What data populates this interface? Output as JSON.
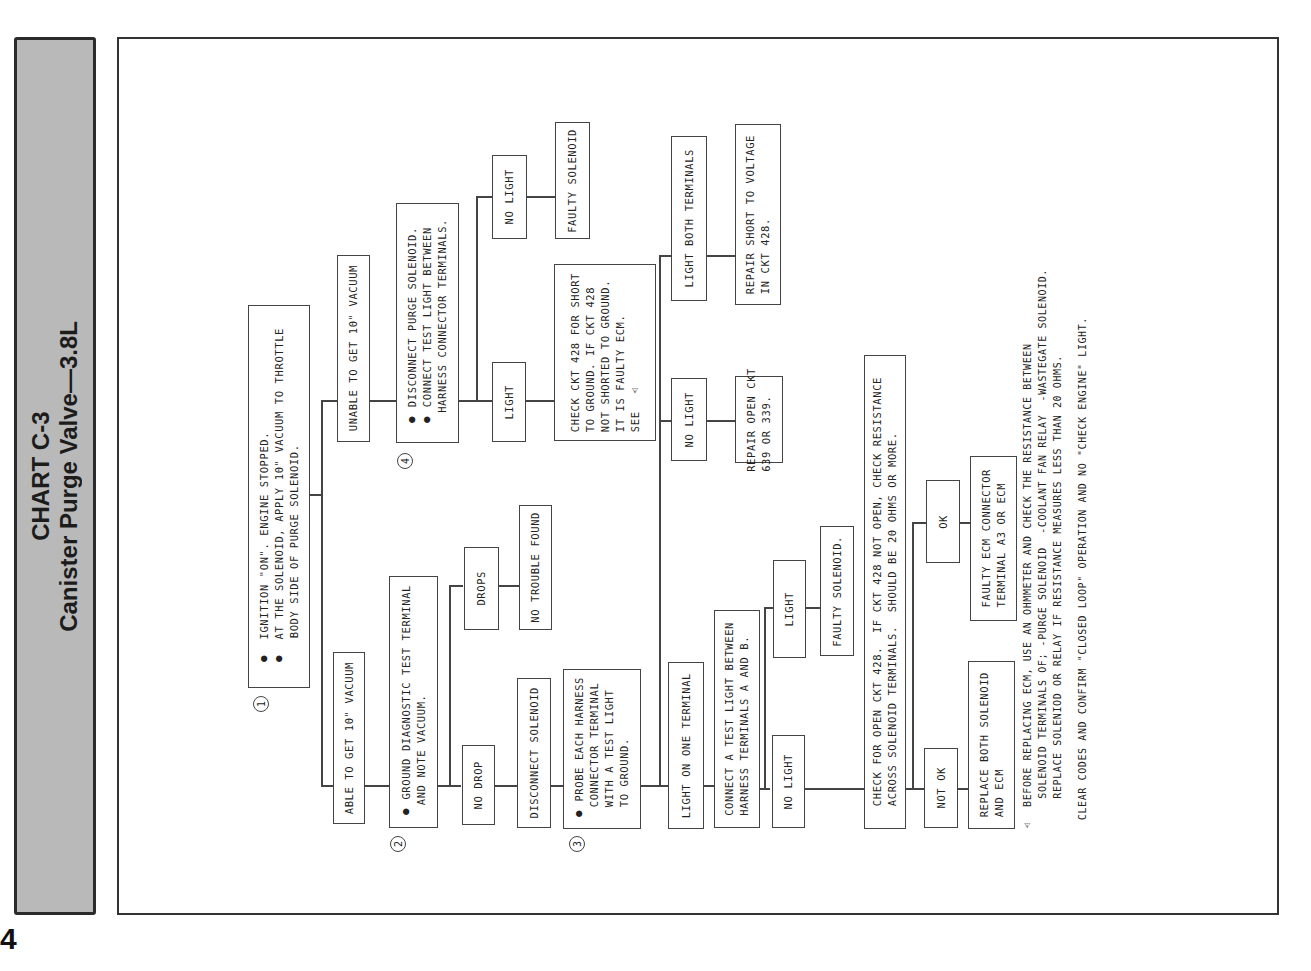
{
  "page_number": "4",
  "header": {
    "chart_id": "CHART C-3",
    "title": "Canister Purge Valve—3.8L"
  },
  "steps": {
    "s1": {
      "num": "1",
      "text": "●  IGNITION \"ON\". ENGINE STOPPED.\n●  AT THE SOLENOID, APPLY 10\" VACUUM TO THROTTLE\n    BODY SIDE OF PURGE SOLENOID."
    },
    "able": "ABLE TO GET 10\" VACUUM",
    "unable": "UNABLE TO GET 10\" VACUUM",
    "s2": {
      "num": "2",
      "text": "● GROUND DIAGNOSTIC TEST TERMINAL\n  AND NOTE VACUUM."
    },
    "no_drop": "NO DROP",
    "drops": "DROPS",
    "no_trouble": "NO TROUBLE FOUND",
    "disconnect_solenoid": "DISCONNECT SOLENOID",
    "s3": {
      "num": "3",
      "text": "● PROBE EACH HARNESS\n  CONNECTOR TERMINAL\n  WITH A TEST LIGHT\n  TO GROUND."
    },
    "light_one": "LIGHT ON ONE TERMINAL",
    "light_both": "LIGHT BOTH TERMINALS",
    "repair_short_voltage": "REPAIR SHORT TO VOLTAGE\nIN CKT 428.",
    "no_light_probe": "NO LIGHT",
    "repair_open": "REPAIR OPEN CKT\n639 OR 339.",
    "connect_ab": "CONNECT A TEST LIGHT BETWEEN\nHARNESS TERMINALS A AND B.",
    "light_ab": "LIGHT",
    "faulty_solenoid_ab": "FAULTY SOLENOID.",
    "no_light_ab": "NO LIGHT",
    "check_open": "CHECK FOR OPEN CKT 428.  IF CKT 428 NOT OPEN, CHECK RESISTANCE\nACROSS SOLENOID TERMINALS.  SHOULD BE 20 OHMS OR MORE.",
    "not_ok": "NOT OK",
    "ok": "OK",
    "replace_both": "REPLACE BOTH SOLENOID\nAND ECM",
    "faulty_ecm": "FAULTY ECM CONNECTOR\nTERMINAL A3 OR ECM",
    "s4": {
      "num": "4",
      "text": "● DISCONNECT PURGE SOLENOID.\n● CONNECT TEST LIGHT BETWEEN\n  HARNESS CONNECTOR TERMINALS."
    },
    "light_s4": "LIGHT",
    "no_light_s4": "NO LIGHT",
    "faulty_solenoid_s4": "FAULTY SOLENOID",
    "check_ckt_short": "CHECK CKT 428 FOR SHORT\nTO GROUND. IF CKT 428\nNOT SHORTED TO GROUND.\nIT IS FAULTY ECM.\nSEE  ⚠"
  },
  "notes": {
    "warning": "⚠  BEFORE REPLACING ECM, USE AN OHMMETER AND CHECK THE RESISTANCE BETWEEN\n     SOLENOID TERMINALS OF; -PURGE SOLENOID  -COOLANT FAN RELAY  -WASTEGATE SOLENOID.\n     REPLACE SOLENIOD OR RELAY IF RESISTANCE MEASURES LESS THAN 20 OHMS.",
    "clear_codes": "CLEAR CODES AND CONFIRM \"CLOSED LOOP\" OPERATION AND NO \"CHECK ENGINE\" LIGHT."
  }
}
